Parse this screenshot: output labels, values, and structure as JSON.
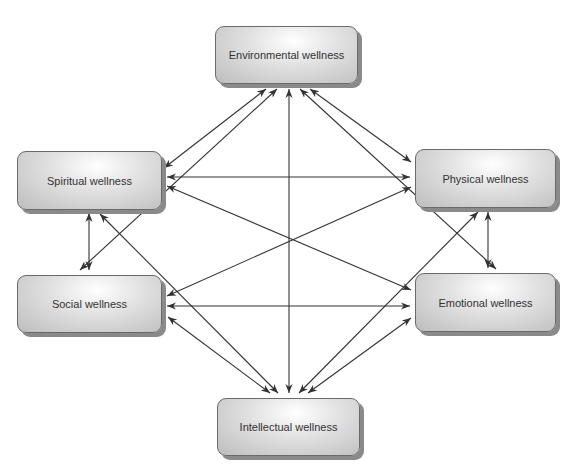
{
  "diagram": {
    "type": "network",
    "colors": {
      "box_border": "#6a6a6a",
      "box_shadow": "#8a8a8a",
      "arrow": "#333333",
      "text": "#333333"
    },
    "nodes": {
      "environmental": {
        "label": "Environmental wellness"
      },
      "spiritual": {
        "label": "Spiritual wellness"
      },
      "physical": {
        "label": "Physical wellness"
      },
      "social": {
        "label": "Social wellness"
      },
      "emotional": {
        "label": "Emotional wellness"
      },
      "intellectual": {
        "label": "Intellectual wellness"
      }
    },
    "edges": [
      {
        "from": "environmental",
        "to": "spiritual",
        "direction": "both"
      },
      {
        "from": "environmental",
        "to": "social",
        "direction": "both"
      },
      {
        "from": "environmental",
        "to": "intellectual",
        "direction": "both"
      },
      {
        "from": "environmental",
        "to": "physical",
        "direction": "both"
      },
      {
        "from": "environmental",
        "to": "emotional",
        "direction": "both"
      },
      {
        "from": "spiritual",
        "to": "physical",
        "direction": "both"
      },
      {
        "from": "spiritual",
        "to": "emotional",
        "direction": "both"
      },
      {
        "from": "spiritual",
        "to": "social",
        "direction": "both"
      },
      {
        "from": "spiritual",
        "to": "intellectual",
        "direction": "both"
      },
      {
        "from": "social",
        "to": "physical",
        "direction": "both"
      },
      {
        "from": "social",
        "to": "emotional",
        "direction": "both"
      },
      {
        "from": "social",
        "to": "intellectual",
        "direction": "both"
      },
      {
        "from": "physical",
        "to": "emotional",
        "direction": "both"
      },
      {
        "from": "physical",
        "to": "intellectual",
        "direction": "both"
      },
      {
        "from": "emotional",
        "to": "intellectual",
        "direction": "both"
      }
    ]
  }
}
